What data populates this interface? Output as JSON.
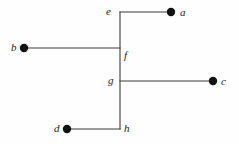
{
  "figure": {
    "width": 239,
    "height": 144,
    "background_color": "#fefefe",
    "line_color": "#3a3a3a",
    "dot_color": "#111111",
    "label_color": "#1a1a1a"
  },
  "chart_data": {
    "type": "diagram",
    "subtype": "tree-graph",
    "title": "",
    "xlabel": "",
    "ylabel": "",
    "grid": false,
    "legend": null,
    "nodes": [
      {
        "id": "a",
        "label": "a",
        "kind": "leaf",
        "marker": "filled-dot",
        "x": 171,
        "y": 12,
        "label_x": 180,
        "label_y": 7
      },
      {
        "id": "b",
        "label": "b",
        "kind": "leaf",
        "marker": "filled-dot",
        "x": 24,
        "y": 48,
        "label_x": 11,
        "label_y": 42
      },
      {
        "id": "c",
        "label": "c",
        "kind": "leaf",
        "marker": "filled-dot",
        "x": 213,
        "y": 81,
        "label_x": 221,
        "label_y": 76
      },
      {
        "id": "d",
        "label": "d",
        "kind": "leaf",
        "marker": "filled-dot",
        "x": 67,
        "y": 129,
        "label_x": 54,
        "label_y": 123
      },
      {
        "id": "e",
        "label": "e",
        "kind": "internal",
        "marker": "none",
        "x": 120,
        "y": 12,
        "label_x": 106,
        "label_y": 6
      },
      {
        "id": "f",
        "label": "f",
        "kind": "internal",
        "marker": "none",
        "x": 120,
        "y": 48,
        "label_x": 124,
        "label_y": 50
      },
      {
        "id": "g",
        "label": "g",
        "kind": "internal",
        "marker": "none",
        "x": 120,
        "y": 81,
        "label_x": 108,
        "label_y": 75
      },
      {
        "id": "h",
        "label": "h",
        "kind": "internal",
        "marker": "none",
        "x": 120,
        "y": 129,
        "label_x": 124,
        "label_y": 123
      }
    ],
    "edges": [
      {
        "from": "e",
        "to": "a",
        "orientation": "horizontal",
        "x1": 120,
        "y1": 12,
        "x2": 171,
        "y2": 12
      },
      {
        "from": "b",
        "to": "f",
        "orientation": "horizontal",
        "x1": 24,
        "y1": 48,
        "x2": 120,
        "y2": 48
      },
      {
        "from": "g",
        "to": "c",
        "orientation": "horizontal",
        "x1": 120,
        "y1": 81,
        "x2": 213,
        "y2": 81
      },
      {
        "from": "d",
        "to": "h",
        "orientation": "horizontal",
        "x1": 67,
        "y1": 129,
        "x2": 120,
        "y2": 129
      },
      {
        "from": "e",
        "to": "h",
        "orientation": "vertical",
        "x1": 120,
        "y1": 12,
        "x2": 120,
        "y2": 129
      }
    ],
    "marker_radius": 4.2,
    "line_width": 1.1
  }
}
